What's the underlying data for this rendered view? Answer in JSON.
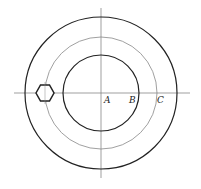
{
  "diagram": {
    "center": {
      "x": 101,
      "y": 93
    },
    "circles": [
      {
        "name": "outer",
        "r": 76,
        "stroke": "#222222",
        "width": 1.2
      },
      {
        "name": "middle",
        "r": 56,
        "stroke": "#888888",
        "width": 0.8
      },
      {
        "name": "inner",
        "r": 38,
        "stroke": "#222222",
        "width": 1.2
      }
    ],
    "labels": {
      "a": "A",
      "b": "B",
      "c": "C"
    },
    "hexagon": {
      "cx": 45,
      "cy": 93,
      "r": 9
    }
  }
}
